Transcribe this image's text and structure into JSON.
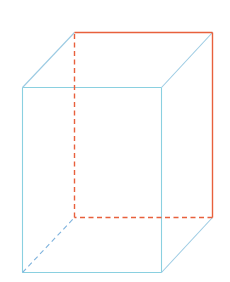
{
  "diagram": {
    "title": "Rectangular prism (cuboid) with highlighted back face edges",
    "type": "3d-wireframe-cuboid",
    "colors": {
      "background": "#ffffff",
      "front_edges": "#8ad0e0",
      "side_edges": "#9ccbe3",
      "highlight_edges": "#e8603c",
      "hidden_blue": "#7fb3dd"
    },
    "vertices": {
      "front_top_left": [
        22,
        87
      ],
      "front_top_right": [
        161,
        87
      ],
      "front_bottom_right": [
        161,
        272
      ],
      "front_bottom_left": [
        22,
        272
      ],
      "back_top_left": [
        74,
        32
      ],
      "back_top_right": [
        212,
        32
      ],
      "back_bottom_right": [
        212,
        217
      ],
      "back_bottom_left": [
        74,
        217
      ]
    },
    "edges": [
      {
        "name": "front-top",
        "from": "front_top_left",
        "to": "front_top_right",
        "style": "solid",
        "color": "front"
      },
      {
        "name": "front-right",
        "from": "front_top_right",
        "to": "front_bottom_right",
        "style": "solid",
        "color": "front"
      },
      {
        "name": "front-bottom",
        "from": "front_bottom_right",
        "to": "front_bottom_left",
        "style": "solid",
        "color": "front"
      },
      {
        "name": "front-left",
        "from": "front_bottom_left",
        "to": "front_top_left",
        "style": "solid",
        "color": "front"
      },
      {
        "name": "top-left-depth",
        "from": "front_top_left",
        "to": "back_top_left",
        "style": "solid",
        "color": "side"
      },
      {
        "name": "top-right-depth",
        "from": "front_top_right",
        "to": "back_top_right",
        "style": "solid",
        "color": "side"
      },
      {
        "name": "bottom-right-depth",
        "from": "front_bottom_right",
        "to": "back_bottom_right",
        "style": "solid",
        "color": "side"
      },
      {
        "name": "bottom-left-depth",
        "from": "front_bottom_left",
        "to": "back_bottom_left",
        "style": "dashed",
        "color": "hidden_blue"
      },
      {
        "name": "back-top",
        "from": "back_top_left",
        "to": "back_top_right",
        "style": "solid",
        "color": "highlight"
      },
      {
        "name": "back-right",
        "from": "back_top_right",
        "to": "back_bottom_right",
        "style": "solid",
        "color": "highlight"
      },
      {
        "name": "back-bottom",
        "from": "back_bottom_right",
        "to": "back_bottom_left",
        "style": "dashed",
        "color": "highlight"
      },
      {
        "name": "back-left",
        "from": "back_bottom_left",
        "to": "back_top_left",
        "style": "dashed",
        "color": "highlight"
      }
    ]
  }
}
